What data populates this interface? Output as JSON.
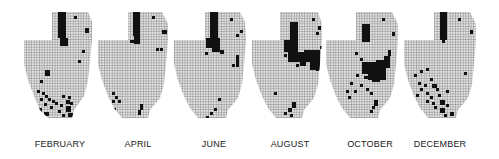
{
  "figure": {
    "type": "grid-map-series",
    "grid_color": "#3a3a3a",
    "fill_color": "#d9d9d9",
    "mark_color": "#111111",
    "panels": [
      {
        "label": "FEBRUARY",
        "cx": 60,
        "outline": "52,12 88,12 92,22 92,40 90,60 88,80 84,96 74,110 72,118 48,118 40,110 34,96 28,80 24,64 24,40 52,40",
        "marks": [
          [
            58,
            12,
            8,
            26
          ],
          [
            60,
            38,
            8,
            8
          ],
          [
            74,
            16,
            3,
            3
          ],
          [
            85,
            28,
            4,
            5
          ],
          [
            82,
            50,
            3,
            3
          ],
          [
            78,
            60,
            3,
            3
          ],
          [
            45,
            70,
            5,
            6
          ],
          [
            40,
            80,
            3,
            3
          ],
          [
            37,
            90,
            3,
            3
          ],
          [
            42,
            92,
            3,
            3
          ],
          [
            45,
            95,
            3,
            3
          ],
          [
            40,
            98,
            3,
            3
          ],
          [
            48,
            98,
            3,
            3
          ],
          [
            52,
            100,
            3,
            3
          ],
          [
            44,
            103,
            3,
            3
          ],
          [
            50,
            106,
            3,
            3
          ],
          [
            55,
            102,
            3,
            3
          ],
          [
            60,
            104,
            3,
            3
          ],
          [
            66,
            100,
            4,
            4
          ],
          [
            70,
            102,
            3,
            3
          ],
          [
            62,
            95,
            3,
            3
          ],
          [
            68,
            96,
            3,
            3
          ],
          [
            58,
            110,
            3,
            3
          ],
          [
            38,
            108,
            4,
            6
          ],
          [
            44,
            112,
            5,
            4
          ],
          [
            66,
            106,
            5,
            6
          ],
          [
            68,
            113,
            5,
            4
          ],
          [
            62,
            114,
            3,
            3
          ]
        ]
      },
      {
        "label": "APRIL",
        "cx": 138,
        "outline": "128,12 162,12 168,24 168,40 166,64 164,84 160,98 150,110 148,118 122,118 114,108 108,96 102,80 98,64 98,40 128,40",
        "marks": [
          [
            133,
            12,
            7,
            24
          ],
          [
            134,
            34,
            6,
            10
          ],
          [
            130,
            40,
            4,
            3
          ],
          [
            152,
            16,
            3,
            3
          ],
          [
            162,
            30,
            5,
            4
          ],
          [
            156,
            48,
            3,
            3
          ],
          [
            160,
            48,
            3,
            3
          ],
          [
            112,
            92,
            3,
            3
          ],
          [
            115,
            96,
            3,
            3
          ],
          [
            112,
            100,
            3,
            3
          ],
          [
            118,
            100,
            3,
            3
          ],
          [
            113,
            108,
            3,
            3
          ],
          [
            140,
            104,
            3,
            6
          ],
          [
            138,
            110,
            3,
            5
          ]
        ]
      },
      {
        "label": "JUNE",
        "cx": 214,
        "outline": "205,12 240,12 245,22 246,40 244,64 242,84 238,98 228,110 226,118 198,118 190,108 184,96 178,80 174,64 174,40 205,40",
        "marks": [
          [
            210,
            12,
            8,
            28
          ],
          [
            206,
            38,
            14,
            10
          ],
          [
            212,
            46,
            8,
            6
          ],
          [
            220,
            50,
            4,
            4
          ],
          [
            205,
            52,
            3,
            3
          ],
          [
            230,
            18,
            3,
            3
          ],
          [
            240,
            30,
            3,
            3
          ],
          [
            236,
            34,
            3,
            3
          ],
          [
            236,
            55,
            3,
            12
          ],
          [
            232,
            64,
            3,
            3
          ],
          [
            218,
            98,
            3,
            3
          ],
          [
            214,
            108,
            3,
            3
          ],
          [
            210,
            112,
            3,
            3
          ],
          [
            206,
            116,
            3,
            3
          ]
        ]
      },
      {
        "label": "AUGUST",
        "cx": 290,
        "outline": "280,12 318,12 322,24 322,40 320,64 318,84 314,98 304,110 302,118 276,118 268,108 262,96 256,80 252,64 252,40 280,40",
        "marks": [
          [
            290,
            22,
            8,
            22
          ],
          [
            284,
            40,
            14,
            12
          ],
          [
            288,
            52,
            20,
            10
          ],
          [
            304,
            50,
            16,
            12
          ],
          [
            310,
            62,
            10,
            8
          ],
          [
            300,
            62,
            6,
            4
          ],
          [
            284,
            54,
            3,
            3
          ],
          [
            296,
            64,
            3,
            3
          ],
          [
            312,
            18,
            3,
            3
          ],
          [
            318,
            26,
            3,
            4
          ],
          [
            316,
            32,
            3,
            3
          ],
          [
            320,
            46,
            3,
            3
          ],
          [
            316,
            68,
            3,
            3
          ],
          [
            274,
            92,
            3,
            3
          ],
          [
            292,
            102,
            4,
            6
          ],
          [
            288,
            108,
            4,
            4
          ],
          [
            284,
            112,
            3,
            3
          ],
          [
            290,
            114,
            3,
            3
          ]
        ]
      },
      {
        "label": "OCTOBER",
        "cx": 370,
        "outline": "356,12 392,12 398,24 398,40 396,64 394,84 390,98 380,110 378,118 350,118 342,108 336,96 330,80 326,64 326,40 356,40",
        "marks": [
          [
            362,
            24,
            8,
            18
          ],
          [
            382,
            18,
            3,
            3
          ],
          [
            392,
            32,
            3,
            4
          ],
          [
            355,
            52,
            3,
            3
          ],
          [
            360,
            58,
            3,
            3
          ],
          [
            362,
            62,
            14,
            12
          ],
          [
            368,
            66,
            18,
            14
          ],
          [
            376,
            60,
            8,
            8
          ],
          [
            384,
            56,
            6,
            12
          ],
          [
            388,
            50,
            3,
            6
          ],
          [
            372,
            74,
            8,
            8
          ],
          [
            364,
            76,
            4,
            3
          ],
          [
            356,
            74,
            3,
            3
          ],
          [
            360,
            84,
            3,
            3
          ],
          [
            350,
            82,
            3,
            3
          ],
          [
            346,
            90,
            3,
            3
          ],
          [
            354,
            90,
            3,
            3
          ],
          [
            348,
            96,
            3,
            3
          ],
          [
            366,
            88,
            3,
            3
          ],
          [
            370,
            92,
            3,
            3
          ],
          [
            374,
            100,
            4,
            6
          ],
          [
            372,
            106,
            3,
            3
          ],
          [
            370,
            110,
            3,
            3
          ]
        ]
      },
      {
        "label": "DECEMBER",
        "cx": 440,
        "outline": "434,12 470,12 476,24 476,40 474,64 472,84 468,98 458,110 456,118 428,118 420,108 414,96 408,80 404,64 404,40 434,40",
        "marks": [
          [
            440,
            12,
            7,
            28
          ],
          [
            442,
            40,
            3,
            3
          ],
          [
            458,
            18,
            3,
            3
          ],
          [
            470,
            30,
            3,
            4
          ],
          [
            464,
            72,
            3,
            3
          ],
          [
            414,
            74,
            3,
            3
          ],
          [
            420,
            70,
            3,
            3
          ],
          [
            426,
            68,
            3,
            3
          ],
          [
            430,
            78,
            3,
            3
          ],
          [
            418,
            82,
            3,
            3
          ],
          [
            424,
            84,
            3,
            3
          ],
          [
            432,
            84,
            5,
            4
          ],
          [
            436,
            88,
            3,
            3
          ],
          [
            420,
            88,
            3,
            3
          ],
          [
            416,
            94,
            3,
            3
          ],
          [
            426,
            92,
            3,
            3
          ],
          [
            430,
            96,
            3,
            3
          ],
          [
            438,
            94,
            3,
            3
          ],
          [
            446,
            90,
            3,
            3
          ],
          [
            426,
            100,
            3,
            3
          ],
          [
            432,
            102,
            3,
            3
          ],
          [
            440,
            100,
            5,
            5
          ],
          [
            434,
            106,
            3,
            3
          ],
          [
            440,
            108,
            5,
            5
          ],
          [
            446,
            104,
            3,
            3
          ],
          [
            450,
            112,
            4,
            4
          ],
          [
            444,
            114,
            3,
            3
          ],
          [
            438,
            118,
            3,
            3
          ],
          [
            444,
            118,
            3,
            3
          ]
        ]
      }
    ]
  }
}
